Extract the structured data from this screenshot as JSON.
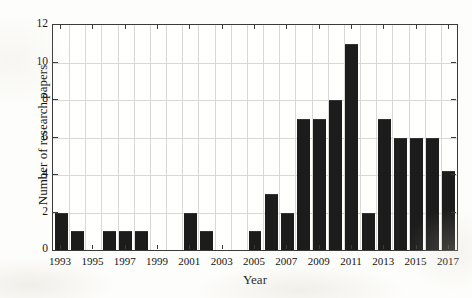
{
  "chart_data": {
    "type": "bar",
    "title": "",
    "xlabel": "Year",
    "ylabel": "Number of research papers",
    "ylim": [
      0,
      12
    ],
    "yticks": [
      0,
      2,
      4,
      6,
      8,
      10,
      12
    ],
    "xticks_labeled": [
      1993,
      1995,
      1997,
      1999,
      2001,
      2003,
      2005,
      2007,
      2009,
      2011,
      2013,
      2015,
      2017
    ],
    "grid": true,
    "legend": "none",
    "bar_color": "#1c1c1c",
    "categories": [
      1993,
      1994,
      1995,
      1996,
      1997,
      1998,
      1999,
      2000,
      2001,
      2002,
      2003,
      2004,
      2005,
      2006,
      2007,
      2008,
      2009,
      2010,
      2011,
      2012,
      2013,
      2014,
      2015,
      2016,
      2017
    ],
    "values": [
      2,
      1,
      0,
      1,
      1,
      1,
      0,
      0,
      2,
      1,
      0,
      0,
      1,
      3,
      2,
      7,
      7,
      8,
      11,
      2,
      7,
      6,
      6,
      6,
      4.2
    ]
  },
  "axes": {
    "y_tick_labels": [
      "0",
      "2",
      "4",
      "6",
      "8",
      "10",
      "12"
    ],
    "x_tick_labels": [
      "1993",
      "1995",
      "1997",
      "1999",
      "2001",
      "2003",
      "2005",
      "2007",
      "2009",
      "2011",
      "2013",
      "2015",
      "2017"
    ],
    "y_axis_title": "Number of research papers",
    "x_axis_title": "Year"
  }
}
